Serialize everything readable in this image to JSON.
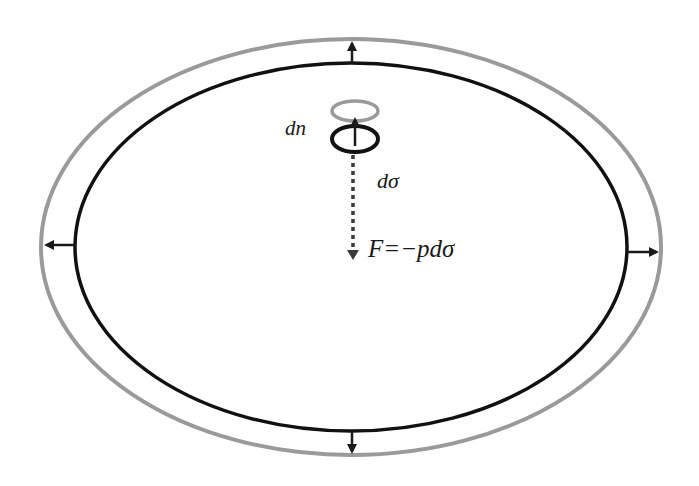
{
  "diagram": {
    "type": "pressure-expansion-surface",
    "colors": {
      "background": "#ffffff",
      "inner_surface": "#111111",
      "outer_surface": "#9a9a9a",
      "arrow": "#1a1a1a",
      "force_arrow": "#3a3a3a",
      "text": "#1a1a1a"
    },
    "outer_ellipse": {
      "cx": 351,
      "cy": 247,
      "rx": 310,
      "ry": 208,
      "description": "expanded surface (grey)"
    },
    "inner_ellipse": {
      "cx": 351,
      "cy": 247,
      "rx": 276,
      "ry": 184,
      "description": "original surface (black)"
    },
    "expansion_arrows": [
      {
        "name": "top",
        "direction": "up"
      },
      {
        "name": "bottom",
        "direction": "down"
      },
      {
        "name": "left",
        "direction": "left"
      },
      {
        "name": "right",
        "direction": "right"
      }
    ],
    "surface_element": {
      "displaced_element_color": "grey",
      "original_element_color": "black",
      "normal_arrow": "up"
    },
    "labels": {
      "displacement": "dn",
      "area_element": "dσ",
      "force": "F=−pdσ"
    }
  }
}
